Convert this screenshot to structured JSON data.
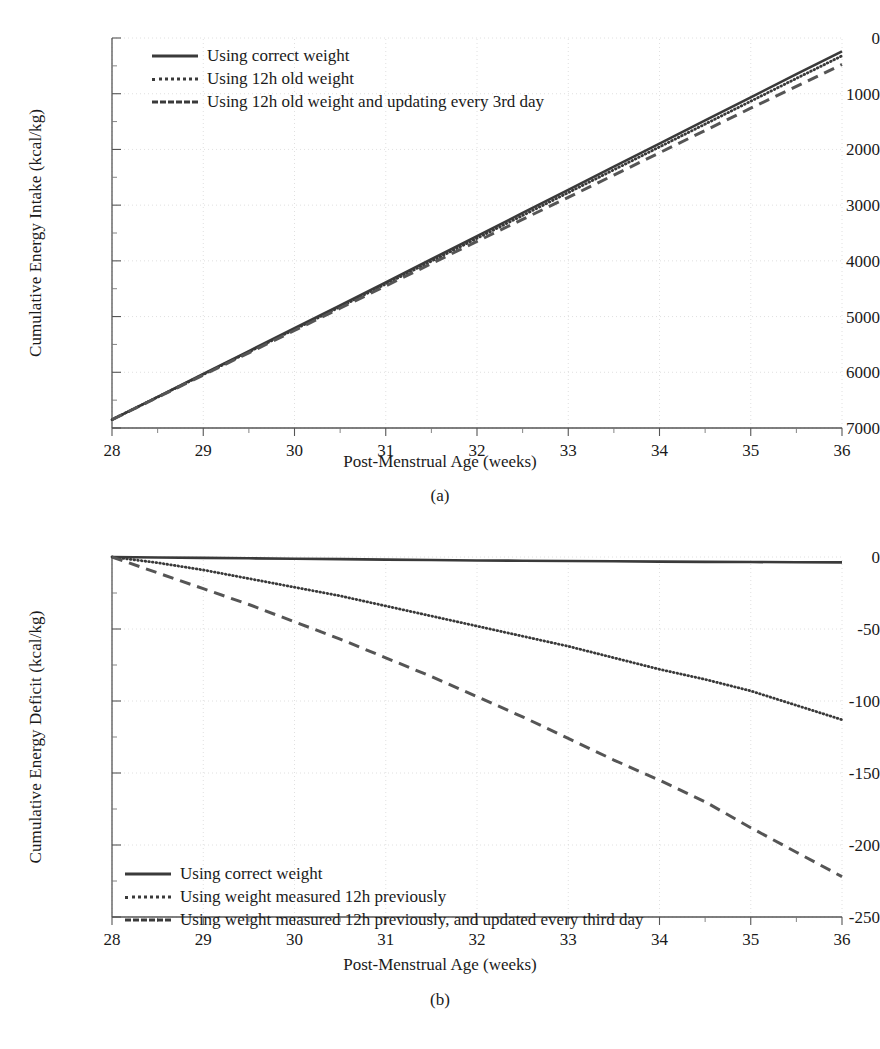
{
  "figure": {
    "panels": [
      {
        "id": "a",
        "caption": "(a)",
        "xlabel": "Post-Menstrual Age (weeks)",
        "ylabel": "Cumulative Energy Intake (kcal/kg)",
        "xticks": [
          "28",
          "29",
          "30",
          "31",
          "32",
          "33",
          "34",
          "35",
          "36"
        ],
        "yticks": [
          "7000",
          "6000",
          "5000",
          "4000",
          "3000",
          "2000",
          "1000",
          "0"
        ],
        "legend": [
          {
            "style": "solid",
            "label": "Using correct weight"
          },
          {
            "style": "dotted",
            "label": "Using 12h old weight"
          },
          {
            "style": "dashed",
            "label": "Using 12h old weight and updating every 3rd day"
          }
        ]
      },
      {
        "id": "b",
        "caption": "(b)",
        "xlabel": "Post-Menstrual Age (weeks)",
        "ylabel": "Cumulative Energy Deficit (kcal/kg)",
        "xticks": [
          "28",
          "29",
          "30",
          "31",
          "32",
          "33",
          "34",
          "35",
          "36"
        ],
        "yticks": [
          "0",
          "-50",
          "-100",
          "-150",
          "-200",
          "-250"
        ],
        "legend": [
          {
            "style": "solid",
            "label": "Using correct weight"
          },
          {
            "style": "dotted",
            "label": "Using weight measured 12h previously"
          },
          {
            "style": "dashed",
            "label": "Using weight measured 12h previously, and updated every third day"
          }
        ]
      }
    ]
  },
  "chart_data": [
    {
      "type": "line",
      "panel": "a",
      "title": "",
      "xlabel": "Post-Menstrual Age (weeks)",
      "ylabel": "Cumulative Energy Intake (kcal/kg)",
      "xlim": [
        28,
        36
      ],
      "ylim": [
        0,
        7000
      ],
      "xticks": [
        28,
        29,
        30,
        31,
        32,
        33,
        34,
        35,
        36
      ],
      "yticks": [
        0,
        1000,
        2000,
        3000,
        4000,
        5000,
        6000,
        7000
      ],
      "grid": true,
      "legend_position": "upper-left-inside",
      "x": [
        28,
        28.5,
        29,
        29.5,
        30,
        30.5,
        31,
        31.5,
        32,
        32.5,
        33,
        33.5,
        34,
        34.5,
        35,
        35.5,
        36
      ],
      "series": [
        {
          "name": "Using correct weight",
          "style": "solid",
          "values": [
            150,
            560,
            970,
            1380,
            1790,
            2200,
            2615,
            3030,
            3445,
            3860,
            4275,
            4690,
            5105,
            5520,
            5935,
            6350,
            6760
          ]
        },
        {
          "name": "Using 12h old weight",
          "style": "dotted",
          "values": [
            150,
            555,
            960,
            1365,
            1770,
            2175,
            2585,
            2995,
            3405,
            3815,
            4225,
            4635,
            5045,
            5455,
            5865,
            6275,
            6680
          ]
        },
        {
          "name": "Using 12h old weight and updating every 3rd day",
          "style": "dashed",
          "values": [
            150,
            550,
            950,
            1350,
            1750,
            2150,
            2550,
            2950,
            3350,
            3745,
            4140,
            4540,
            4940,
            5340,
            5740,
            6130,
            6525
          ]
        }
      ]
    },
    {
      "type": "line",
      "panel": "b",
      "title": "",
      "xlabel": "Post-Menstrual Age (weeks)",
      "ylabel": "Cumulative Energy Deficit (kcal/kg)",
      "xlim": [
        28,
        36
      ],
      "ylim": [
        -250,
        0
      ],
      "xticks": [
        28,
        29,
        30,
        31,
        32,
        33,
        34,
        35,
        36
      ],
      "yticks": [
        0,
        -50,
        -100,
        -150,
        -200,
        -250
      ],
      "grid": true,
      "legend_position": "lower-left-inside",
      "x": [
        28,
        28.5,
        29,
        29.5,
        30,
        30.5,
        31,
        31.5,
        32,
        32.5,
        33,
        33.5,
        34,
        34.5,
        35,
        35.5,
        36
      ],
      "series": [
        {
          "name": "Using correct weight",
          "style": "solid",
          "values": [
            0,
            -0.3,
            -0.6,
            -0.9,
            -1.2,
            -1.5,
            -1.8,
            -2.1,
            -2.4,
            -2.6,
            -2.8,
            -3.0,
            -3.2,
            -3.4,
            -3.5,
            -3.6,
            -3.7
          ]
        },
        {
          "name": "Using weight measured 12h previously",
          "style": "dotted",
          "values": [
            0,
            -4,
            -9,
            -15,
            -21,
            -27,
            -34,
            -41,
            -48,
            -55,
            -62,
            -70,
            -78,
            -85,
            -93,
            -103,
            -113
          ]
        },
        {
          "name": "Using weight measured 12h previously, and updated every third day",
          "style": "dashed",
          "values": [
            0,
            -11,
            -22,
            -33,
            -45,
            -57,
            -70,
            -83,
            -97,
            -111,
            -126,
            -141,
            -155,
            -170,
            -188,
            -205,
            -222
          ]
        }
      ]
    }
  ]
}
